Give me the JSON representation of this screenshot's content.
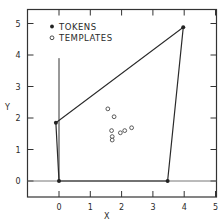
{
  "chart_data": {
    "type": "scatter",
    "title": "",
    "xlabel": "X",
    "ylabel": "Y",
    "xlim": [
      -1,
      5
    ],
    "ylim": [
      -0.5,
      5.5
    ],
    "xticks": [
      0,
      1,
      2,
      3,
      4,
      5
    ],
    "yticks": [
      0,
      1,
      2,
      3,
      4,
      5
    ],
    "grid": false,
    "legend_position": "upper left",
    "series": [
      {
        "name": "TOKENS",
        "marker": "filled-circle",
        "points": [
          {
            "x": 0.0,
            "y": 0.0
          },
          {
            "x": -0.1,
            "y": 1.85
          },
          {
            "x": 3.97,
            "y": 4.88
          },
          {
            "x": 3.47,
            "y": 0.0
          }
        ],
        "polygon": true
      },
      {
        "name": "TEMPLATES",
        "marker": "open-circle",
        "points": [
          {
            "x": 1.56,
            "y": 2.29
          },
          {
            "x": 1.76,
            "y": 2.04
          },
          {
            "x": 1.68,
            "y": 1.6
          },
          {
            "x": 1.7,
            "y": 1.41
          },
          {
            "x": 1.7,
            "y": 1.3
          },
          {
            "x": 1.96,
            "y": 1.53
          },
          {
            "x": 2.1,
            "y": 1.6
          },
          {
            "x": 2.32,
            "y": 1.69
          }
        ]
      }
    ],
    "reference_lines": [
      {
        "type": "vertical",
        "x": 0,
        "y_from": 0,
        "y_to": 3.9
      },
      {
        "type": "horizontal",
        "y": 0
      }
    ]
  },
  "legend": {
    "tokens_label": "TOKENS",
    "templates_label": "TEMPLATES"
  },
  "axes": {
    "x_label": "X",
    "y_label": "Y",
    "x_tick_labels": [
      "0",
      "1",
      "2",
      "3",
      "4",
      "5"
    ],
    "y_tick_labels": [
      "0",
      "1",
      "2",
      "3",
      "4",
      "5"
    ]
  }
}
